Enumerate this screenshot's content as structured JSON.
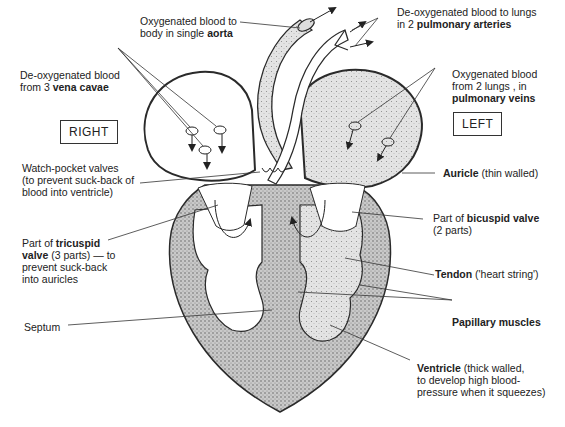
{
  "side_labels": {
    "right": "RIGHT",
    "left": "LEFT"
  },
  "labels": {
    "aorta": {
      "line1": "Oxygenated blood to",
      "line2_pre": "body in single ",
      "line2_bold": "aorta"
    },
    "pulmonary_arteries": {
      "line1": "De-oxygenated blood to lungs",
      "line2_pre": "in 2 ",
      "line2_bold": "pulmonary arteries"
    },
    "vena_cavae": {
      "line1": "De-oxygenated blood",
      "line2_pre": "from 3 ",
      "line2_bold": "vena cavae"
    },
    "pulmonary_veins": {
      "line1": "Oxygenated blood",
      "line2": "from 2 lungs , in",
      "line3_bold": "pulmonary veins"
    },
    "watch_pocket": {
      "line1": "Watch-pocket valves",
      "line2": "(to prevent suck-back of",
      "line3": "blood into ventricle)"
    },
    "auricle": {
      "bold": "Auricle",
      "rest": " (thin walled)"
    },
    "tricuspid": {
      "line1_pre": "Part of ",
      "line1_bold": "tricuspid",
      "line2_bold": "valve",
      "line2_rest": " (3 parts) — to",
      "line3": "prevent suck-back",
      "line4": "into auricles"
    },
    "bicuspid": {
      "line1_pre": "Part of ",
      "line1_bold": "bicuspid valve",
      "line2": "(2 parts)"
    },
    "tendon": {
      "bold": "Tendon",
      "rest": " ('heart string')"
    },
    "septum": {
      "text": "Septum"
    },
    "papillary": {
      "bold": "Papillary muscles"
    },
    "ventricle": {
      "line1_bold": "Ventricle",
      "line1_rest": " (thick walled,",
      "line2": "to develop high blood-",
      "line3": "pressure when it squeezes)"
    }
  },
  "colors": {
    "ink": "#2a2a2a",
    "wall": "#a9a9a9",
    "oxygenated": "#d4d4d4",
    "deoxygenated": "#ffffff"
  }
}
